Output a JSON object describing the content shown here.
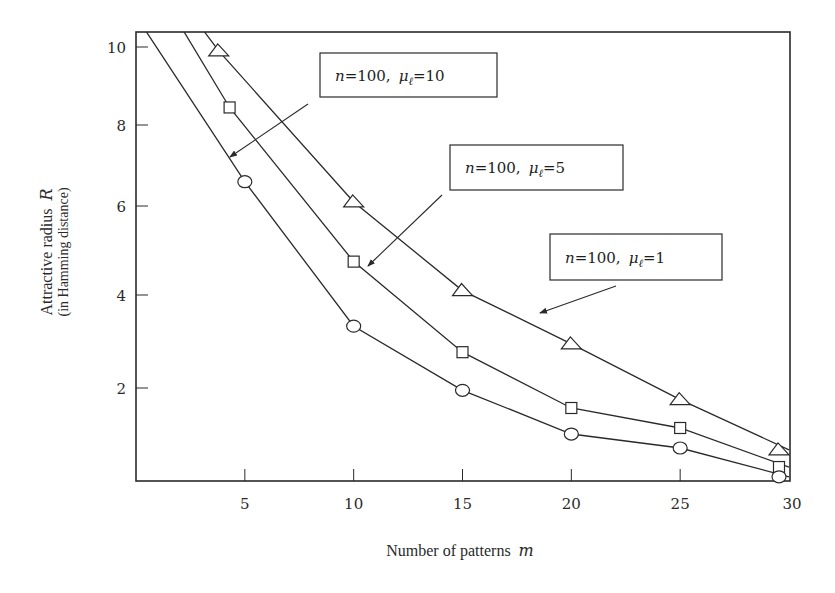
{
  "chart_data": {
    "type": "line",
    "title": "",
    "xlabel": "Number of patterns",
    "xlabel_var": "m",
    "ylabel": "Attractive  radius",
    "ylabel_var": "R",
    "ylabel_sub": "(in Hamming distance)",
    "xlim": [
      0,
      30
    ],
    "ylim": [
      0,
      10.4
    ],
    "x_ticks": [
      5,
      10,
      15,
      20,
      25,
      30
    ],
    "x_tick_labels": [
      "5",
      "10",
      "15",
      "20",
      "25",
      "30"
    ],
    "y_ticks": [
      2,
      4,
      6,
      8,
      10
    ],
    "y_tick_labels": [
      "2",
      "4",
      "6",
      "8",
      "10"
    ],
    "grid": false,
    "legend": "none",
    "series": [
      {
        "name": "n=100, μℓ=1",
        "marker": "triangle",
        "x": [
          2.6,
          3.8,
          10,
          15,
          20,
          25,
          30
        ],
        "y": [
          11.0,
          9.9,
          6.1,
          4.1,
          2.95,
          1.75,
          0.67
        ],
        "marker_from_index": 1
      },
      {
        "name": "n=100, μℓ=5",
        "marker": "square",
        "x": [
          1.6,
          4.3,
          10,
          15,
          20,
          25,
          30
        ],
        "y": [
          11.2,
          8.45,
          4.75,
          2.77,
          1.57,
          1.14,
          0.3
        ],
        "marker_from_index": 1
      },
      {
        "name": "n=100, μℓ=10",
        "marker": "circle",
        "x": [
          0.0,
          5,
          10,
          15,
          20,
          25,
          30
        ],
        "y": [
          11.0,
          6.6,
          3.33,
          1.95,
          1.01,
          0.71,
          0.09
        ],
        "marker_from_index": 1
      }
    ],
    "annotations": [
      {
        "id": "ann-mu10",
        "n_text": "n",
        "eq1": "=100,",
        "mu_text": "μ",
        "sub": "ℓ",
        "eq2": "=10",
        "arrow_to": [
          4.3,
          7.6
        ]
      },
      {
        "id": "ann-mu5",
        "n_text": "n",
        "eq1": "=100,",
        "mu_text": "μ",
        "sub": "ℓ",
        "eq2": "=5",
        "arrow_to": [
          10.7,
          4.65
        ]
      },
      {
        "id": "ann-mu1",
        "n_text": "n",
        "eq1": "=100,",
        "mu_text": "μ",
        "sub": "ℓ",
        "eq2": "=1",
        "arrow_to": [
          18.5,
          3.7
        ]
      }
    ]
  },
  "colors": {
    "ink": "#2a2a2a",
    "background": "#ffffff"
  }
}
